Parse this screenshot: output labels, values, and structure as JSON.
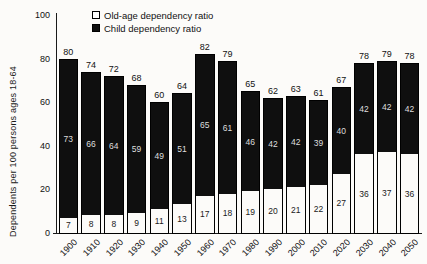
{
  "chart_data": {
    "type": "bar",
    "stacked": true,
    "title": "",
    "ylabel": "Dependents per 100 persons ages 18-64",
    "xlabel": "",
    "categories": [
      "1900",
      "1910",
      "1920",
      "1930",
      "1940",
      "1950",
      "1960",
      "1970",
      "1980",
      "1990",
      "2000",
      "2010",
      "2020",
      "2030",
      "2040",
      "2050"
    ],
    "series": [
      {
        "name": "Old-age dependency ratio",
        "color": "#ffffff",
        "values": [
          7,
          8,
          8,
          9,
          11,
          13,
          17,
          18,
          19,
          20,
          21,
          22,
          27,
          36,
          37,
          36
        ]
      },
      {
        "name": "Child dependency ratio",
        "color": "#0f0f0f",
        "values": [
          73,
          66,
          64,
          59,
          49,
          51,
          65,
          61,
          46,
          42,
          42,
          39,
          40,
          42,
          42,
          42
        ]
      }
    ],
    "bar_total_labels": [
      80,
      74,
      72,
      68,
      60,
      64,
      82,
      79,
      65,
      62,
      63,
      61,
      67,
      78,
      79,
      78
    ],
    "ylim": [
      0,
      100
    ],
    "yticks": [
      0,
      20,
      40,
      60,
      80,
      100
    ],
    "grid": false,
    "legend_position": "top-left-inside"
  }
}
